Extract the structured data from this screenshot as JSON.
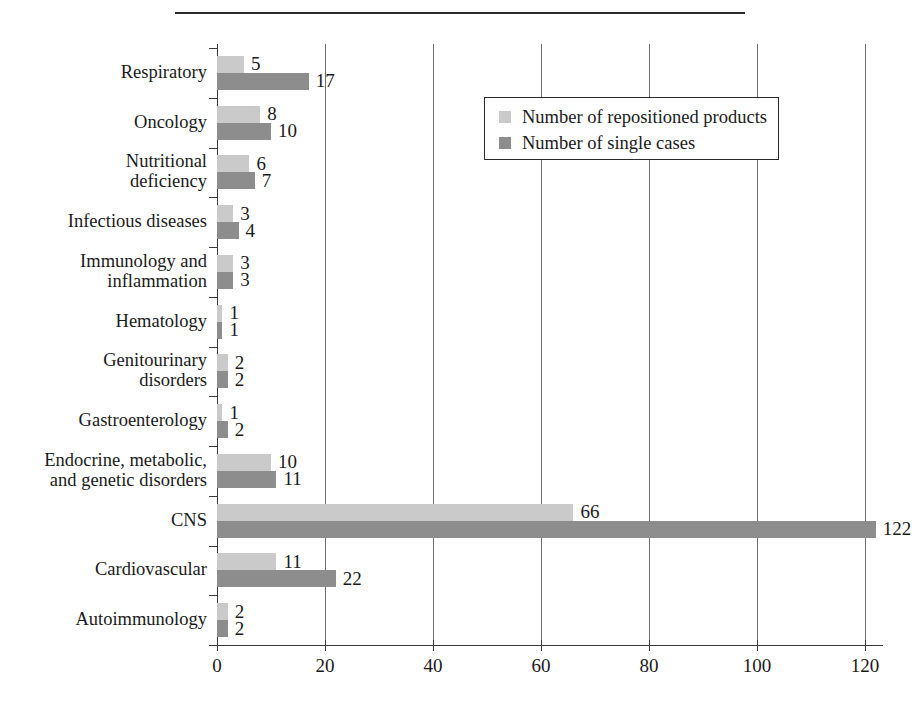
{
  "figure": {
    "has_top_rule": true
  },
  "legend": {
    "position": "top-right-inside",
    "items": [
      {
        "label": "Number of repositioned products",
        "color": "#cacaca",
        "swatch_name": "legend-swatch-repositioned"
      },
      {
        "label": "Number of single cases",
        "color": "#8d8d8d",
        "swatch_name": "legend-swatch-single-cases"
      }
    ]
  },
  "chart_data": {
    "type": "bar",
    "orientation": "horizontal",
    "title": "",
    "subtitle": "",
    "xlabel": "",
    "ylabel": "",
    "xlim": [
      0,
      120
    ],
    "ylim": null,
    "grid": true,
    "grid_axis": "x",
    "xticks": [
      0,
      20,
      40,
      60,
      80,
      100,
      120
    ],
    "xtick_labels": [
      "0",
      "20",
      "40",
      "60",
      "80",
      "100",
      "120"
    ],
    "categories": [
      "Respiratory",
      "Oncology",
      "Nutritional deficiency",
      "Infectious diseases",
      "Immunology and inflammation",
      "Hematology",
      "Genitourinary disorders",
      "Gastroenterology",
      "Endocrine, metabolic, and genetic disorders",
      "CNS",
      "Cardiovascular",
      "Autoimmunology"
    ],
    "category_label_lines": [
      [
        "Respiratory"
      ],
      [
        "Oncology"
      ],
      [
        "Nutritional",
        "deficiency"
      ],
      [
        "Infectious diseases"
      ],
      [
        "Immunology and",
        "inflammation"
      ],
      [
        "Hematology"
      ],
      [
        "Genitourinary",
        "disorders"
      ],
      [
        "Gastroenterology"
      ],
      [
        "Endocrine, metabolic,",
        "and genetic disorders"
      ],
      [
        "CNS"
      ],
      [
        "Cardiovascular"
      ],
      [
        "Autoimmunology"
      ]
    ],
    "series": [
      {
        "name": "Number of repositioned products",
        "color": "#cacaca",
        "values": [
          5,
          8,
          6,
          3,
          3,
          1,
          2,
          1,
          10,
          66,
          11,
          2
        ]
      },
      {
        "name": "Number of single cases",
        "color": "#8d8d8d",
        "values": [
          17,
          10,
          7,
          4,
          3,
          1,
          2,
          2,
          11,
          122,
          22,
          2
        ]
      }
    ],
    "data_labels": true
  }
}
